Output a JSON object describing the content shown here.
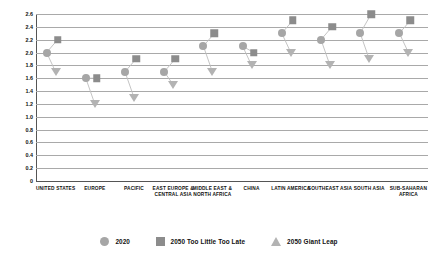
{
  "chart_data": {
    "type": "scatter",
    "title": "",
    "xlabel": "",
    "ylabel": "",
    "ylim": [
      0,
      2.6
    ],
    "ytick_step": 0.2,
    "grid": true,
    "legend_position": "bottom",
    "ytick_labels": [
      "2.6",
      "2.4",
      "2.2",
      "2.0",
      "1.8",
      "1.6",
      "1.4",
      "1.2",
      "1.0",
      "0.8",
      "0.6",
      "0.4",
      "0.2",
      "0"
    ],
    "categories": [
      "UNITED STATES",
      "EUROPE",
      "PACIFIC",
      "EAST EUROPE & CENTRAL ASIA",
      "MIDDLE EAST & NORTH AFRICA",
      "CHINA",
      "LATIN AMERICA",
      "SOUTHEAST ASIA",
      "SOUTH ASIA",
      "SUB-SAHARAN AFRICA"
    ],
    "series": [
      {
        "name": "2020",
        "marker": "circle",
        "color": "#a6a6a6",
        "values": [
          2.0,
          1.6,
          1.7,
          1.7,
          2.1,
          2.1,
          2.3,
          2.2,
          2.3,
          2.3
        ]
      },
      {
        "name": "2050 Too Little Too Late",
        "marker": "square",
        "color": "#8c8c8c",
        "values": [
          2.2,
          1.6,
          1.9,
          1.9,
          2.3,
          2.0,
          2.5,
          2.4,
          2.6,
          2.5
        ]
      },
      {
        "name": "2050 Giant Leap",
        "marker": "triangle",
        "color": "#b3b3b3",
        "values": [
          1.7,
          1.2,
          1.3,
          1.5,
          1.7,
          1.8,
          2.0,
          1.8,
          1.9,
          2.0
        ]
      }
    ]
  },
  "legend": {
    "items": [
      {
        "label": "2020",
        "icon": "circle-marker-icon"
      },
      {
        "label": "2050 Too Little Too Late",
        "icon": "square-marker-icon"
      },
      {
        "label": "2050 Giant Leap",
        "icon": "triangle-marker-icon"
      }
    ]
  },
  "colors": {
    "grid": "#a9a9a9",
    "axis": "#555555",
    "background": "#ffffff",
    "text": "#111111"
  }
}
